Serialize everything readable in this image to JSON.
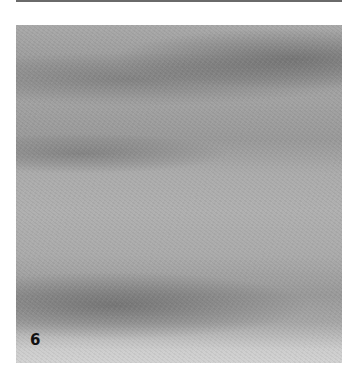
{
  "figure": {
    "panel_label": "6"
  },
  "colors": {
    "background": "#ffffff",
    "panel_base": "#a8a8a8",
    "band_dark": "#8a8a8a",
    "label": "#111111"
  }
}
